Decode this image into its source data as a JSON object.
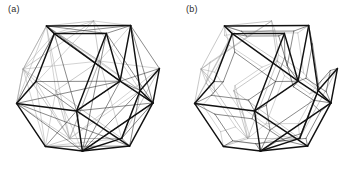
{
  "figure": {
    "type": "line-drawing",
    "background_color": "#ffffff",
    "width": 355,
    "height": 169
  },
  "panels": [
    {
      "id": "a",
      "label": "(a)",
      "variant": "pentagram-diagonals",
      "description": "Regular dodecahedron wireframe with all five diagonals drawn inside each pentagonal face, forming a pentagram in every face.",
      "inner_mode": "diagonals",
      "inner_scale": 0,
      "center_x": 88,
      "center_y": 86,
      "radius": 74
    },
    {
      "id": "b",
      "label": "(b)",
      "variant": "inset-pentagons",
      "description": "Regular dodecahedron wireframe with a smaller concentric pentagon inset inside each pentagonal face.",
      "inner_mode": "inset",
      "inner_scale": 0.62,
      "center_x": 88,
      "center_y": 86,
      "radius": 74
    }
  ],
  "style": {
    "front_edge_color": "#111111",
    "back_edge_color": "#9a9a9a",
    "inner_front_color": "#3a3a3a",
    "inner_back_color": "#a6a6a6",
    "front_edge_width": 1.45,
    "back_edge_width": 0.55,
    "label_color": "#2b2b2b",
    "label_font_size": 9
  },
  "geometry": {
    "solid": "regular dodecahedron",
    "vertices": 20,
    "edges": 30,
    "faces": 12,
    "face_sides": 5,
    "rotation_x_deg": -22,
    "rotation_y_deg": 26,
    "rotation_z_deg": 6
  }
}
